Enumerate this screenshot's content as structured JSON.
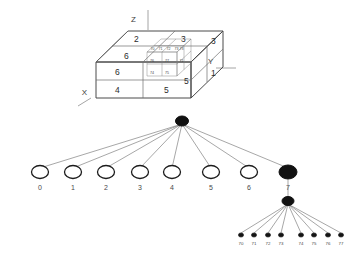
{
  "figure": {
    "background_color": "#ffffff",
    "line_color": "#4a4a4a",
    "node_fill_color": "#111111",
    "node_empty_color": "#ffffff"
  },
  "cube": {
    "axes": [
      {
        "name": "x-axis-label",
        "label": "X"
      },
      {
        "name": "y-axis-label",
        "label": "Y"
      },
      {
        "name": "z-axis-label",
        "label": "Z"
      }
    ],
    "top_face_labels": [
      "2",
      "3"
    ],
    "front_face_labels": [
      "6",
      "4",
      "5"
    ],
    "right_face_labels": [
      "3",
      "1"
    ],
    "octant_labels": [
      "1",
      "2",
      "3",
      "4",
      "5",
      "6"
    ],
    "subcube_labels": [
      "70",
      "71",
      "72",
      "73",
      "74",
      "75",
      "76",
      "77"
    ],
    "subcube_visible_front": [
      "74",
      "75",
      "76",
      "77"
    ],
    "subcube_visible_top": [
      "70",
      "71",
      "72",
      "73"
    ]
  },
  "tree": {
    "root": {
      "label": "",
      "state": "filled"
    },
    "level1": [
      {
        "label": "0",
        "state": "empty"
      },
      {
        "label": "1",
        "state": "empty"
      },
      {
        "label": "2",
        "state": "empty"
      },
      {
        "label": "3",
        "state": "empty"
      },
      {
        "label": "4",
        "state": "empty"
      },
      {
        "label": "5",
        "state": "empty"
      },
      {
        "label": "6",
        "state": "empty"
      },
      {
        "label": "7",
        "state": "filled"
      }
    ],
    "level2_parent": {
      "label": "7",
      "state": "filled"
    },
    "level2": [
      {
        "label": "70",
        "state": "filled"
      },
      {
        "label": "71",
        "state": "filled"
      },
      {
        "label": "72",
        "state": "filled"
      },
      {
        "label": "73",
        "state": "filled"
      },
      {
        "label": "74",
        "state": "filled"
      },
      {
        "label": "75",
        "state": "filled"
      },
      {
        "label": "76",
        "state": "filled"
      },
      {
        "label": "77",
        "state": "filled"
      }
    ]
  }
}
